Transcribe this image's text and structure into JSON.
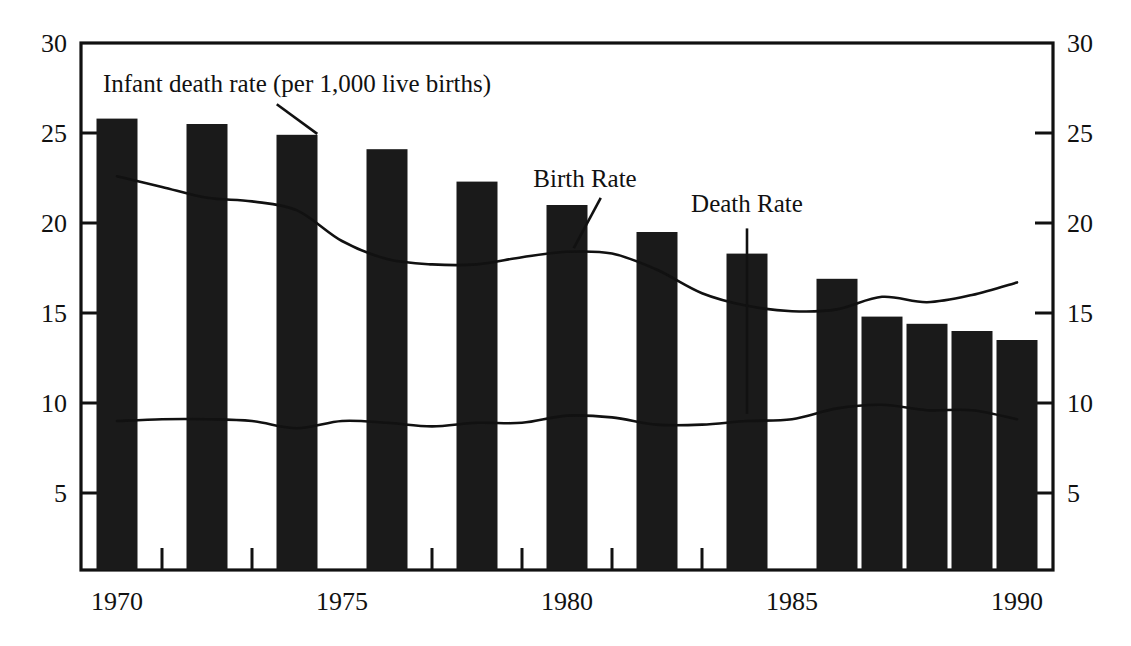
{
  "chart_data": {
    "type": "bar",
    "title": "",
    "subtitle": "",
    "xlabel": "",
    "ylabel": "",
    "ylim": [
      0,
      30
    ],
    "xlim": [
      1969.2,
      1990.8
    ],
    "grid": false,
    "legend_position": "inline-annotations",
    "y_ticks": [
      "5",
      "10",
      "15",
      "20",
      "25",
      "30"
    ],
    "y_tick_values": [
      5,
      10,
      15,
      20,
      25,
      30
    ],
    "x_ticks": [
      "1970",
      "1975",
      "1980",
      "1985",
      "1990"
    ],
    "x_tick_values": [
      1970,
      1975,
      1980,
      1985,
      1990
    ],
    "x_minor_tick_values": [
      1971,
      1973,
      1977,
      1979,
      1981,
      1983,
      1987,
      1989
    ],
    "dual_axis": true,
    "axis_color": "#111111",
    "bar_color": "#1a1a1a",
    "line_color": "#111111",
    "annotations": [
      {
        "name": "infant-death-rate-label",
        "text": "Infant death rate (per 1,000 live births)",
        "x": 1974.0,
        "y": 27.3
      },
      {
        "name": "birth-rate-label",
        "text": "Birth Rate",
        "x": 1980.4,
        "y": 22.0
      },
      {
        "name": "death-rate-label",
        "text": "Death Rate",
        "x": 1984.0,
        "y": 20.6
      }
    ],
    "series": [
      {
        "name": "Infant death rate (per 1,000 live births)",
        "type": "bar",
        "x": [
          1970,
          1972,
          1974,
          1976,
          1978,
          1980,
          1982,
          1984,
          1986,
          1987,
          1988,
          1989,
          1990
        ],
        "values": [
          25.8,
          25.5,
          24.9,
          24.1,
          22.3,
          21.0,
          19.5,
          18.3,
          16.9,
          14.8,
          14.4,
          14.0,
          13.5
        ]
      },
      {
        "name": "Birth Rate",
        "type": "line",
        "x": [
          1970,
          1971,
          1972,
          1973,
          1974,
          1975,
          1976,
          1977,
          1978,
          1979,
          1980,
          1981,
          1982,
          1983,
          1984,
          1985,
          1986,
          1987,
          1988,
          1989,
          1990
        ],
        "values": [
          22.6,
          22.0,
          21.4,
          21.2,
          20.7,
          19.0,
          18.0,
          17.7,
          17.7,
          18.1,
          18.4,
          18.3,
          17.4,
          16.1,
          15.4,
          15.1,
          15.2,
          15.9,
          15.6,
          16.0,
          16.7
        ]
      },
      {
        "name": "Death Rate",
        "type": "line",
        "x": [
          1970,
          1971,
          1972,
          1973,
          1974,
          1975,
          1976,
          1977,
          1978,
          1979,
          1980,
          1981,
          1982,
          1983,
          1984,
          1985,
          1986,
          1987,
          1988,
          1989,
          1990
        ],
        "values": [
          9.0,
          9.1,
          9.1,
          9.0,
          8.6,
          9.0,
          8.9,
          8.7,
          8.9,
          8.9,
          9.3,
          9.2,
          8.8,
          8.8,
          9.0,
          9.1,
          9.7,
          9.9,
          9.6,
          9.6,
          9.1
        ]
      }
    ]
  }
}
